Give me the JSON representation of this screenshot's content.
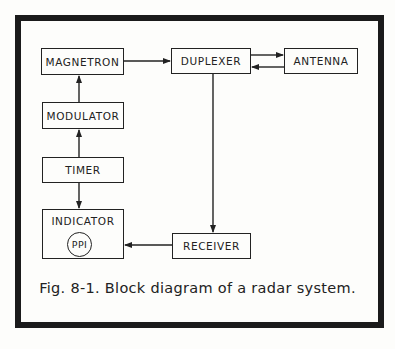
{
  "diagram": {
    "type": "block-diagram",
    "blocks": [
      {
        "id": "magnetron",
        "label": "MAGNETRON"
      },
      {
        "id": "duplexer",
        "label": "DUPLEXER"
      },
      {
        "id": "antenna",
        "label": "ANTENNA"
      },
      {
        "id": "modulator",
        "label": "MODULATOR"
      },
      {
        "id": "timer",
        "label": "TIMER"
      },
      {
        "id": "indicator",
        "label": "INDICATOR",
        "inner": "PPI"
      },
      {
        "id": "receiver",
        "label": "RECEIVER"
      }
    ],
    "connections": [
      {
        "from": "timer",
        "to": "modulator"
      },
      {
        "from": "modulator",
        "to": "magnetron"
      },
      {
        "from": "magnetron",
        "to": "duplexer"
      },
      {
        "from": "duplexer",
        "to": "antenna"
      },
      {
        "from": "antenna",
        "to": "duplexer"
      },
      {
        "from": "duplexer",
        "to": "receiver"
      },
      {
        "from": "receiver",
        "to": "indicator"
      },
      {
        "from": "timer",
        "to": "indicator"
      }
    ],
    "caption": "Fig. 8-1. Block diagram of a radar system."
  }
}
